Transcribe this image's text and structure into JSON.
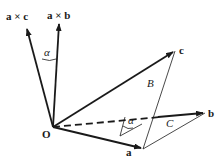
{
  "diagram": {
    "labels": {
      "a_cross_c": "a × c",
      "a_cross_b": "a × b",
      "alpha_top": "α",
      "alpha_bottom": "α",
      "origin": "O",
      "vec_a": "a",
      "vec_b": "b",
      "vec_c": "c",
      "face_B": "B",
      "face_C": "C"
    },
    "points": {
      "O": [
        53,
        127
      ],
      "a": [
        143,
        149
      ],
      "b": [
        205,
        113
      ],
      "c": [
        175,
        51
      ],
      "a_cross_b": [
        59,
        22
      ],
      "a_cross_c": [
        26,
        27
      ]
    },
    "colors": {
      "stroke": "#1a1a1a",
      "background": "#ffffff"
    }
  }
}
